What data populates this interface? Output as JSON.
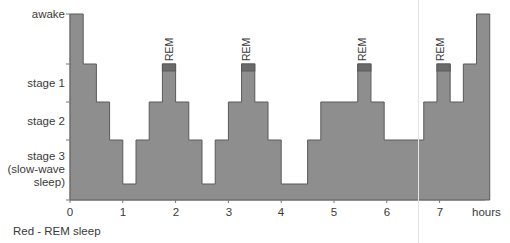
{
  "chart_data": {
    "type": "step",
    "title": "",
    "xlabel": "hours",
    "ylabel": "",
    "x_ticks": [
      "0",
      "1",
      "2",
      "3",
      "4",
      "5",
      "6",
      "7"
    ],
    "xlim": [
      0,
      7.9
    ],
    "y_levels": [
      "awake",
      "stage 1",
      "stage 2",
      "stage 3 (slow-wave sleep)",
      "stage 3 deep"
    ],
    "y_tick_labels": [
      {
        "label": "awake",
        "lines": [
          "awake"
        ]
      },
      {
        "label": "stage 1",
        "lines": [
          "stage 1"
        ]
      },
      {
        "label": "stage 2",
        "lines": [
          "stage 2"
        ]
      },
      {
        "label": "stage 3 (slow-wave sleep)",
        "lines": [
          "stage 3",
          "(slow-wave",
          "sleep)"
        ]
      }
    ],
    "segments": [
      {
        "start": 0.0,
        "end": 0.25,
        "stage": "awake"
      },
      {
        "start": 0.25,
        "end": 0.5,
        "stage": "stage 1"
      },
      {
        "start": 0.5,
        "end": 0.75,
        "stage": "stage 2"
      },
      {
        "start": 0.75,
        "end": 1.0,
        "stage": "stage 3"
      },
      {
        "start": 1.0,
        "end": 1.25,
        "stage": "deep"
      },
      {
        "start": 1.25,
        "end": 1.5,
        "stage": "stage 3"
      },
      {
        "start": 1.5,
        "end": 1.75,
        "stage": "stage 2"
      },
      {
        "start": 1.75,
        "end": 2.0,
        "stage": "REM"
      },
      {
        "start": 2.0,
        "end": 2.25,
        "stage": "stage 2"
      },
      {
        "start": 2.25,
        "end": 2.5,
        "stage": "stage 3"
      },
      {
        "start": 2.5,
        "end": 2.75,
        "stage": "deep"
      },
      {
        "start": 2.75,
        "end": 3.0,
        "stage": "stage 3"
      },
      {
        "start": 3.0,
        "end": 3.25,
        "stage": "stage 2"
      },
      {
        "start": 3.25,
        "end": 3.5,
        "stage": "REM"
      },
      {
        "start": 3.5,
        "end": 3.75,
        "stage": "stage 2"
      },
      {
        "start": 3.75,
        "end": 4.0,
        "stage": "stage 3"
      },
      {
        "start": 4.0,
        "end": 4.5,
        "stage": "deep"
      },
      {
        "start": 4.5,
        "end": 4.75,
        "stage": "stage 3"
      },
      {
        "start": 4.75,
        "end": 5.45,
        "stage": "stage 2"
      },
      {
        "start": 5.45,
        "end": 5.7,
        "stage": "REM"
      },
      {
        "start": 5.7,
        "end": 5.95,
        "stage": "stage 2"
      },
      {
        "start": 5.95,
        "end": 6.7,
        "stage": "stage 3"
      },
      {
        "start": 6.7,
        "end": 6.95,
        "stage": "stage 2"
      },
      {
        "start": 6.95,
        "end": 7.2,
        "stage": "REM"
      },
      {
        "start": 7.2,
        "end": 7.45,
        "stage": "stage 2"
      },
      {
        "start": 7.45,
        "end": 7.7,
        "stage": "stage 1"
      },
      {
        "start": 7.7,
        "end": 7.95,
        "stage": "awake"
      }
    ],
    "annotations": [
      "REM",
      "REM",
      "REM",
      "REM"
    ],
    "legend": "Red - REM sleep",
    "grid": false,
    "colors": {
      "fill": "#8e8e8e",
      "stroke": "#5a5a5a",
      "rem_cap": "#6a6a6a",
      "axis": "#555555"
    }
  },
  "labels": {
    "awake": "awake",
    "stage1": "stage 1",
    "stage2": "stage 2",
    "stage3_l1": "stage 3",
    "stage3_l2": "(slow-wave",
    "stage3_l3": "sleep)",
    "x0": "0",
    "x1": "1",
    "x2": "2",
    "x3": "3",
    "x4": "4",
    "x5": "5",
    "x6": "6",
    "x7": "7",
    "hours": "hours",
    "caption": "Red - REM sleep",
    "rem": "REM"
  }
}
